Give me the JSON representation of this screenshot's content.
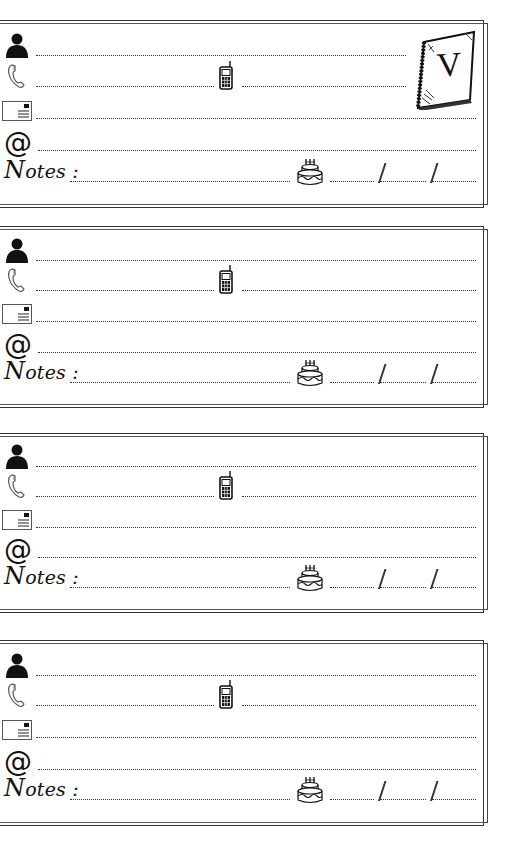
{
  "page": {
    "section_letter": "V",
    "background": "#ffffff",
    "ink_color": "#111111"
  },
  "cards": [
    {
      "top": 20,
      "height": 188,
      "has_letter_badge": true,
      "rows": {
        "name": {
          "icon": "person-icon"
        },
        "phone": {
          "icon": "phone-icon",
          "mobile_icon": "mobile-phone-icon"
        },
        "address": {
          "icon": "envelope-icon"
        },
        "email": {
          "icon": "at-sign-icon",
          "symbol": "@"
        },
        "notes": {
          "label_initial": "N",
          "label_rest": "otes :",
          "birthday_icon": "birthday-cake-icon",
          "date_separator": "/"
        }
      }
    },
    {
      "top": 226,
      "height": 182,
      "has_letter_badge": false,
      "rows": {
        "name": {
          "icon": "person-icon"
        },
        "phone": {
          "icon": "phone-icon",
          "mobile_icon": "mobile-phone-icon"
        },
        "address": {
          "icon": "envelope-icon"
        },
        "email": {
          "icon": "at-sign-icon",
          "symbol": "@"
        },
        "notes": {
          "label_initial": "N",
          "label_rest": "otes :",
          "birthday_icon": "birthday-cake-icon",
          "date_separator": "/"
        }
      }
    },
    {
      "top": 433,
      "height": 180,
      "has_letter_badge": false,
      "rows": {
        "name": {
          "icon": "person-icon"
        },
        "phone": {
          "icon": "phone-icon",
          "mobile_icon": "mobile-phone-icon"
        },
        "address": {
          "icon": "envelope-icon"
        },
        "email": {
          "icon": "at-sign-icon",
          "symbol": "@"
        },
        "notes": {
          "label_initial": "N",
          "label_rest": "otes :",
          "birthday_icon": "birthday-cake-icon",
          "date_separator": "/"
        }
      }
    },
    {
      "top": 640,
      "height": 186,
      "has_letter_badge": false,
      "rows": {
        "name": {
          "icon": "person-icon"
        },
        "phone": {
          "icon": "phone-icon",
          "mobile_icon": "mobile-phone-icon"
        },
        "address": {
          "icon": "envelope-icon"
        },
        "email": {
          "icon": "at-sign-icon",
          "symbol": "@"
        },
        "notes": {
          "label_initial": "N",
          "label_rest": "otes :",
          "birthday_icon": "birthday-cake-icon",
          "date_separator": "/"
        }
      }
    }
  ]
}
